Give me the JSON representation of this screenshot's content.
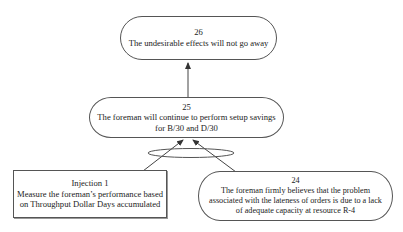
{
  "diagram": {
    "type": "current reality / logic tree",
    "nodes": [
      {
        "id": "26",
        "number": "26",
        "lines": [
          "The undesirable effects will not go away"
        ],
        "shape": "rounded"
      },
      {
        "id": "25",
        "number": "25",
        "lines": [
          "The foreman will continue to perform setup savings",
          "for B/30 and D/30"
        ],
        "shape": "rounded"
      },
      {
        "id": "injection1",
        "number": "Injection 1",
        "lines": [
          "Measure the foreman’s performance based",
          "on Throughput Dollar Days accumulated"
        ],
        "shape": "rectangle"
      },
      {
        "id": "24",
        "number": "24",
        "lines": [
          "The foreman firmly believes that the problem",
          "associated with the lateness of orders is due to a lack",
          "of adequate capacity at resource R-4"
        ],
        "shape": "rounded"
      }
    ],
    "edges": [
      {
        "from": "25",
        "to": "26"
      },
      {
        "from": "injection1",
        "to": "25",
        "and_group": true
      },
      {
        "from": "24",
        "to": "25",
        "and_group": true
      }
    ],
    "colors": {
      "stroke": "#555555",
      "text": "#222222",
      "background": "#ffffff"
    }
  }
}
